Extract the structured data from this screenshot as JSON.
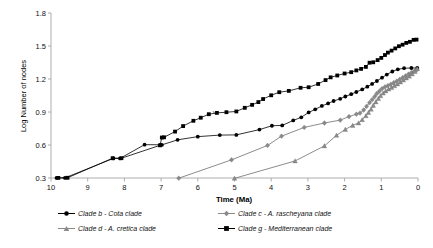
{
  "chart_data": {
    "type": "line",
    "title": "",
    "xlabel": "Time (Ma)",
    "ylabel": "Log Number of nodes",
    "xlim": [
      10,
      0
    ],
    "ylim": [
      0.3,
      1.8
    ],
    "x_reversed": true,
    "grid": false,
    "legend_position": "bottom",
    "xticks": [
      10,
      9,
      8,
      7,
      6,
      5,
      4,
      3,
      2,
      1,
      0
    ],
    "xtick_labels": [
      "10",
      "9",
      "8",
      "7",
      "6",
      "5",
      "4",
      "3",
      "2",
      "1",
      "0"
    ],
    "yticks": [
      0.3,
      0.6,
      0.9,
      1.2,
      1.5,
      1.8
    ],
    "ytick_labels": [
      "0.3",
      "0.6",
      "0.9",
      "1.2",
      "1.5",
      "1.8"
    ],
    "annotations": [
      {
        "text": "v",
        "x": 5.55,
        "y": 0.885
      }
    ],
    "series": [
      {
        "name": "Clade b - Cota clade",
        "key": "clade_b",
        "marker": "circle",
        "color": "#000000",
        "points": [
          [
            9.85,
            0.301
          ],
          [
            9.62,
            0.301
          ],
          [
            8.3,
            0.478
          ],
          [
            8.12,
            0.478
          ],
          [
            7.45,
            0.603
          ],
          [
            7.02,
            0.602
          ],
          [
            6.98,
            0.601
          ],
          [
            6.55,
            0.647
          ],
          [
            6.0,
            0.676
          ],
          [
            5.4,
            0.69
          ],
          [
            4.95,
            0.692
          ],
          [
            4.32,
            0.74
          ],
          [
            3.98,
            0.775
          ],
          [
            3.7,
            0.778
          ],
          [
            3.4,
            0.823
          ],
          [
            3.18,
            0.852
          ],
          [
            2.98,
            0.896
          ],
          [
            2.8,
            0.924
          ],
          [
            2.62,
            0.955
          ],
          [
            2.45,
            0.978
          ],
          [
            2.3,
            1.0
          ],
          [
            2.12,
            1.02
          ],
          [
            1.98,
            1.041
          ],
          [
            1.82,
            1.062
          ],
          [
            1.68,
            1.082
          ],
          [
            1.52,
            1.105
          ],
          [
            1.38,
            1.13
          ],
          [
            1.25,
            1.155
          ],
          [
            1.12,
            1.182
          ],
          [
            0.98,
            1.212
          ],
          [
            0.85,
            1.24
          ],
          [
            0.7,
            1.268
          ],
          [
            0.55,
            1.288
          ],
          [
            0.38,
            1.298
          ],
          [
            0.18,
            1.3
          ],
          [
            0.02,
            1.3
          ]
        ]
      },
      {
        "name": "Clade c - A. rascheyana clade",
        "key": "clade_c",
        "marker": "diamond",
        "color": "#8a8a8a",
        "points": [
          [
            6.52,
            0.298
          ],
          [
            5.08,
            0.465
          ],
          [
            4.1,
            0.596
          ],
          [
            3.72,
            0.68
          ],
          [
            3.1,
            0.76
          ],
          [
            2.55,
            0.8
          ],
          [
            2.12,
            0.826
          ],
          [
            1.88,
            0.858
          ],
          [
            1.68,
            0.88
          ],
          [
            1.58,
            0.89
          ],
          [
            1.48,
            0.918
          ],
          [
            1.4,
            0.952
          ],
          [
            1.32,
            0.985
          ],
          [
            1.25,
            1.012
          ],
          [
            1.18,
            1.04
          ],
          [
            1.12,
            1.068
          ],
          [
            1.05,
            1.09
          ],
          [
            0.98,
            1.112
          ],
          [
            0.9,
            1.128
          ],
          [
            0.82,
            1.14
          ],
          [
            0.74,
            1.152
          ],
          [
            0.66,
            1.166
          ],
          [
            0.58,
            1.18
          ],
          [
            0.5,
            1.196
          ],
          [
            0.42,
            1.212
          ],
          [
            0.34,
            1.228
          ],
          [
            0.26,
            1.244
          ],
          [
            0.18,
            1.258
          ],
          [
            0.1,
            1.272
          ],
          [
            0.03,
            1.285
          ]
        ]
      },
      {
        "name": "Clade d - A. cretica clade",
        "key": "clade_d",
        "marker": "triangle",
        "color": "#8a8a8a",
        "points": [
          [
            5.0,
            0.297
          ],
          [
            3.35,
            0.455
          ],
          [
            2.55,
            0.592
          ],
          [
            2.22,
            0.688
          ],
          [
            1.98,
            0.742
          ],
          [
            1.78,
            0.778
          ],
          [
            1.62,
            0.8
          ],
          [
            1.52,
            0.83
          ],
          [
            1.42,
            0.865
          ],
          [
            1.35,
            0.895
          ],
          [
            1.28,
            0.925
          ],
          [
            1.22,
            0.96
          ],
          [
            1.15,
            0.992
          ],
          [
            1.08,
            1.022
          ],
          [
            1.02,
            1.048
          ],
          [
            0.95,
            1.072
          ],
          [
            0.88,
            1.092
          ],
          [
            0.8,
            1.108
          ],
          [
            0.72,
            1.122
          ],
          [
            0.64,
            1.138
          ],
          [
            0.56,
            1.155
          ],
          [
            0.48,
            1.172
          ],
          [
            0.4,
            1.19
          ],
          [
            0.32,
            1.208
          ],
          [
            0.24,
            1.226
          ],
          [
            0.16,
            1.246
          ],
          [
            0.08,
            1.268
          ],
          [
            0.02,
            1.292
          ]
        ]
      },
      {
        "name": "Clade g - Mediterranean clade",
        "key": "clade_g",
        "marker": "square",
        "color": "#000000",
        "points": [
          [
            9.8,
            0.301
          ],
          [
            9.55,
            0.302
          ],
          [
            8.32,
            0.48
          ],
          [
            8.08,
            0.48
          ],
          [
            7.03,
            0.597
          ],
          [
            6.98,
            0.668
          ],
          [
            6.92,
            0.67
          ],
          [
            6.62,
            0.722
          ],
          [
            6.4,
            0.772
          ],
          [
            6.12,
            0.82
          ],
          [
            5.92,
            0.848
          ],
          [
            5.7,
            0.88
          ],
          [
            5.48,
            0.892
          ],
          [
            5.22,
            0.898
          ],
          [
            4.95,
            0.905
          ],
          [
            4.72,
            0.938
          ],
          [
            4.52,
            0.965
          ],
          [
            4.35,
            0.99
          ],
          [
            4.22,
            1.018
          ],
          [
            4.0,
            1.052
          ],
          [
            3.78,
            1.08
          ],
          [
            3.52,
            1.092
          ],
          [
            3.2,
            1.12
          ],
          [
            2.98,
            1.125
          ],
          [
            2.72,
            1.155
          ],
          [
            2.52,
            1.19
          ],
          [
            2.38,
            1.215
          ],
          [
            2.2,
            1.232
          ],
          [
            2.0,
            1.25
          ],
          [
            1.82,
            1.262
          ],
          [
            1.68,
            1.278
          ],
          [
            1.55,
            1.292
          ],
          [
            1.42,
            1.31
          ],
          [
            1.32,
            1.348
          ],
          [
            1.22,
            1.352
          ],
          [
            1.1,
            1.372
          ],
          [
            1.0,
            1.392
          ],
          [
            0.9,
            1.418
          ],
          [
            0.82,
            1.44
          ],
          [
            0.72,
            1.458
          ],
          [
            0.62,
            1.478
          ],
          [
            0.52,
            1.498
          ],
          [
            0.42,
            1.512
          ],
          [
            0.32,
            1.528
          ],
          [
            0.22,
            1.538
          ],
          [
            0.12,
            1.556
          ],
          [
            0.04,
            1.558
          ]
        ]
      }
    ]
  },
  "legend": {
    "items": [
      {
        "label": "Clade b - Cota clade",
        "marker": "circle",
        "color": "#000000"
      },
      {
        "label": "Clade c - A. rascheyana clade",
        "marker": "diamond",
        "color": "#8a8a8a"
      },
      {
        "label": "Clade d - A. cretica clade",
        "marker": "triangle",
        "color": "#8a8a8a"
      },
      {
        "label": "Clade g - Mediterranean clade",
        "marker": "square",
        "color": "#000000"
      }
    ]
  }
}
